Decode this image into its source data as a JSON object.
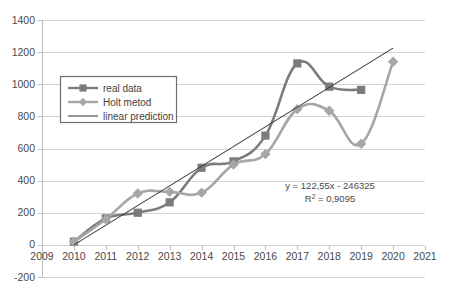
{
  "chart_data": {
    "type": "line",
    "title": "",
    "subtitle": "",
    "xlabel": "",
    "ylabel": "",
    "x": [
      2010,
      2011,
      2012,
      2013,
      2014,
      2015,
      2016,
      2017,
      2018,
      2019,
      2020
    ],
    "x_tick_labels": [
      "2009",
      "2010",
      "2011",
      "2012",
      "2013",
      "2014",
      "2015",
      "2016",
      "2017",
      "2018",
      "2019",
      "2020",
      "2021"
    ],
    "y_tick_labels": [
      "1400",
      "1200",
      "1000",
      "800",
      "600",
      "400",
      "200",
      "0",
      "-200"
    ],
    "xlim": [
      2009,
      2021
    ],
    "ylim": [
      -200,
      1400
    ],
    "y_ticks": [
      -200,
      0,
      200,
      400,
      600,
      800,
      1000,
      1200,
      1400
    ],
    "grid": true,
    "legend_position": "upper-left-inside",
    "series": [
      {
        "name": "real data",
        "marker": "square",
        "color": "#7c7c7c",
        "x": [
          2010,
          2011,
          2012,
          2013,
          2014,
          2015,
          2016,
          2017,
          2018,
          2019
        ],
        "values": [
          20,
          165,
          200,
          265,
          480,
          520,
          680,
          1130,
          985,
          965
        ]
      },
      {
        "name": "Holt metod",
        "marker": "diamond",
        "color": "#a6a6a6",
        "x": [
          2010,
          2011,
          2012,
          2013,
          2014,
          2015,
          2016,
          2017,
          2018,
          2019,
          2020
        ],
        "values": [
          20,
          160,
          320,
          330,
          325,
          500,
          565,
          845,
          835,
          630,
          1140
        ]
      },
      {
        "name": "linear prediction",
        "marker": "none",
        "color": "#3f3f3f",
        "x": [
          2010,
          2020
        ],
        "values": [
          0,
          1225
        ]
      }
    ],
    "annotations": [
      {
        "id": "trend-equation",
        "text": "y = 122,55x - 246325"
      },
      {
        "id": "r-squared",
        "text_prefix": "R",
        "text_sup": "2",
        "text_suffix": " = 0,9095"
      }
    ]
  },
  "legend": {
    "items": [
      {
        "label": "real data"
      },
      {
        "label": "Holt metod"
      },
      {
        "label": "linear prediction"
      }
    ]
  },
  "colors": {
    "real_data": "#7c7c7c",
    "holt": "#a6a6a6",
    "linear": "#3f3f3f",
    "grid": "#d4d4d4",
    "text": "#4a4a4a",
    "background": "#ffffff"
  }
}
